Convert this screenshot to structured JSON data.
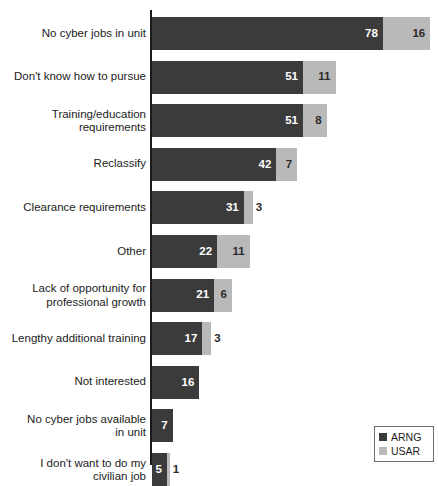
{
  "chart_data": {
    "type": "bar",
    "orientation": "horizontal",
    "stacked": true,
    "title": "",
    "subtitle": "",
    "xlabel": "",
    "ylabel": "",
    "grid": false,
    "axis_visible": true,
    "legend_position": "bottom-right",
    "xlim": [
      0,
      96
    ],
    "categories": [
      "No cyber jobs in unit",
      "Don't know how to pursue",
      "Training/education\nrequirements",
      "Reclassify",
      "Clearance requirements",
      "Other",
      "Lack of opportunity for\nprofessional growth",
      "Lengthy additional training",
      "Not interested",
      "No cyber jobs available\nin unit",
      "I don't want to do my\ncivilian job"
    ],
    "series": [
      {
        "name": "ARNG",
        "color": "#3b3b3b",
        "values": [
          78,
          51,
          51,
          42,
          31,
          22,
          21,
          17,
          16,
          7,
          5
        ]
      },
      {
        "name": "USAR",
        "color": "#b9b9b9",
        "values": [
          16,
          11,
          8,
          7,
          3,
          11,
          6,
          3,
          null,
          null,
          1
        ]
      }
    ],
    "data_labels": [
      {
        "category": "No cyber jobs in unit",
        "arng": "78",
        "usar": "16"
      },
      {
        "category": "Don't know how to pursue",
        "arng": "51",
        "usar": "11"
      },
      {
        "category": "Training/education requirements",
        "arng": "51",
        "usar": "8"
      },
      {
        "category": "Reclassify",
        "arng": "42",
        "usar": "7"
      },
      {
        "category": "Clearance requirements",
        "arng": "31",
        "usar": "3"
      },
      {
        "category": "Other",
        "arng": "22",
        "usar": "11"
      },
      {
        "category": "Lack of opportunity for professional growth",
        "arng": "21",
        "usar": "6"
      },
      {
        "category": "Lengthy additional training",
        "arng": "17",
        "usar": "3"
      },
      {
        "category": "Not interested",
        "arng": "16",
        "usar": ""
      },
      {
        "category": "No cyber jobs available in unit",
        "arng": "7",
        "usar": ""
      },
      {
        "category": "I don't want to do my civilian job",
        "arng": "5",
        "usar": "1"
      }
    ]
  },
  "legend": {
    "items": [
      {
        "label": "ARNG",
        "color": "#3b3b3b"
      },
      {
        "label": "USAR",
        "color": "#b9b9b9"
      }
    ]
  },
  "colors": {
    "arng": "#3b3b3b",
    "usar": "#b9b9b9",
    "axis": "#1a1a1a",
    "text": "#1c1c1c",
    "background": "#ffffff"
  }
}
